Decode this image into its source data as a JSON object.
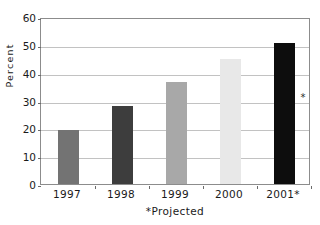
{
  "figure": {
    "title_fragment": "Chart",
    "background_color": "#ffffff"
  },
  "chart_data": {
    "type": "bar",
    "title": "",
    "xlabel": "*Projected",
    "ylabel": "Percent",
    "categories": [
      "1997",
      "1998",
      "1999",
      "2000",
      "2001*"
    ],
    "values": [
      19.5,
      28,
      36.5,
      45,
      50.5
    ],
    "bar_colors": [
      "#737373",
      "#3d3d3d",
      "#a8a8a8",
      "#e8e8e8",
      "#0d0d0d"
    ],
    "ylim": [
      0,
      60
    ],
    "ytick_labels": [
      "0",
      "10",
      "20",
      "30",
      "40",
      "50",
      "60"
    ],
    "ytick_values": [
      0,
      10,
      20,
      30,
      40,
      50,
      60
    ],
    "grid": true,
    "grid_axis": "y",
    "legend": "none",
    "annotations": [
      {
        "text": "*",
        "x": "2001*",
        "y": 33.5
      }
    ]
  }
}
